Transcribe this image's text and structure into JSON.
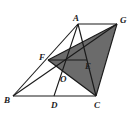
{
  "diagram": {
    "colors": {
      "line": "#1a1a1a",
      "shade": "#6b6b6b",
      "background": "#ffffff"
    },
    "points": {
      "A": {
        "x": 78,
        "y": 24,
        "label": "A",
        "lx": 73,
        "ly": 21
      },
      "G": {
        "x": 117,
        "y": 24,
        "label": "G",
        "lx": 120,
        "ly": 23
      },
      "F": {
        "x": 48,
        "y": 60,
        "label": "F",
        "lx": 39,
        "ly": 60
      },
      "E": {
        "x": 87,
        "y": 60,
        "label": "E",
        "lx": 85,
        "ly": 69
      },
      "O": {
        "x": 63,
        "y": 72,
        "label": "O",
        "lx": 60,
        "ly": 82
      },
      "B": {
        "x": 13,
        "y": 96,
        "label": "B",
        "lx": 4,
        "ly": 103
      },
      "D": {
        "x": 54,
        "y": 96,
        "label": "D",
        "lx": 51,
        "ly": 108
      },
      "C": {
        "x": 96,
        "y": 96,
        "label": "C",
        "lx": 94,
        "ly": 108
      }
    }
  }
}
